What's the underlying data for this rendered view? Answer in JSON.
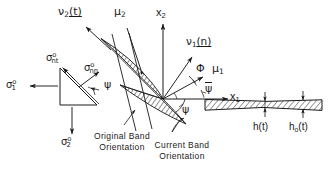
{
  "figure": {
    "background": "#ffffff",
    "ink": "#1a1a1a",
    "band_fill": "#9a9a9a"
  },
  "axes": {
    "x1": {
      "label": "x",
      "sub": "1"
    },
    "x2": {
      "label": "x",
      "sub": "2"
    }
  },
  "vectors": {
    "nu2": {
      "label": "ν",
      "sub": "2",
      "arg": "(t)",
      "arg_underline": true
    },
    "nu1": {
      "label": "ν",
      "sub": "1",
      "arg": "(n)",
      "arg_underline": true
    },
    "mu1": {
      "label": "μ",
      "sub": "1"
    },
    "mu2": {
      "label": "μ",
      "sub": "2"
    }
  },
  "angles": {
    "phi": {
      "label": "Φ"
    },
    "psi_bar": {
      "label": "ψ",
      "overline": true
    },
    "psi_band": {
      "label": "ψ"
    },
    "psi_triangle": {
      "label": "ψ"
    }
  },
  "stresses": {
    "sigma_1": {
      "label": "σ",
      "sub": "1",
      "sup": "o"
    },
    "sigma_2": {
      "label": "σ",
      "sub": "2",
      "sup": "o"
    },
    "sigma_nt": {
      "label": "σ",
      "sub": "nt",
      "sup": "o"
    },
    "sigma_nn": {
      "label": "σ",
      "sub": "nn",
      "sup": "o"
    }
  },
  "captions": {
    "original_band": {
      "line1": "Original  Band",
      "line2": "Orientation"
    },
    "current_band": {
      "line1": "Current  Band",
      "line2": "Orientation"
    }
  },
  "thickness": {
    "h_t": {
      "label": "h",
      "arg": "(t)"
    },
    "h0_t": {
      "label": "h",
      "sub": "o",
      "arg": "(t)"
    }
  }
}
